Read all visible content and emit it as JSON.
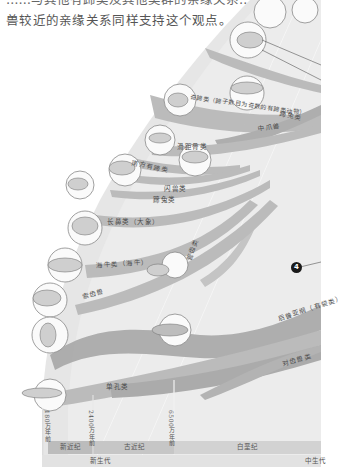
{
  "intro_text": {
    "line1": "……与其他有蹄类及其他类群的亲缘关系……",
    "line2": "兽较近的亲缘关系同样支持这个观点。"
  },
  "diagram": {
    "bands": [
      {
        "id": "perissodactyla_related",
        "label": "蹄兔类"
      },
      {
        "id": "artiodactyla",
        "label": "奇蹄类（蹄子数目为奇数的有蹄类动物）"
      },
      {
        "id": "mesonychia",
        "label": "中爪兽"
      },
      {
        "id": "litopterna",
        "label": "滑距骨类"
      },
      {
        "id": "notoungulata",
        "label": "南方有蹄类"
      },
      {
        "id": "astrapotheria",
        "label": "闪兽类"
      },
      {
        "id": "hyracoidea",
        "label": "蹄兔类"
      },
      {
        "id": "proboscidea",
        "label": "长鼻类（大象）"
      },
      {
        "id": "sirenia",
        "label": "海牛类（海牛）"
      },
      {
        "id": "tubulidentata",
        "label": "管齿类"
      },
      {
        "id": "desmostylia",
        "label": "索齿兽"
      },
      {
        "id": "xenarthra",
        "label": "后兽亚纲（有袋类）"
      },
      {
        "id": "marsupialia",
        "label": "对齿兽类"
      },
      {
        "id": "monotremata",
        "label": "单孔类"
      }
    ],
    "marker": {
      "number": "4"
    },
    "timeline": {
      "ticks": [
        "180万年前",
        "2400万年前",
        "6500万年前"
      ],
      "periods": [
        "新近纪",
        "古近纪",
        "白垩纪"
      ],
      "eras": [
        "新生代",
        "中生代"
      ]
    }
  },
  "colors": {
    "band": "#b8b8b8",
    "band_dark": "#a6a6a6",
    "fan_bg": "#e3e3e3",
    "timeline_bar": "#cfcfcf",
    "text": "#4a4a4a"
  }
}
